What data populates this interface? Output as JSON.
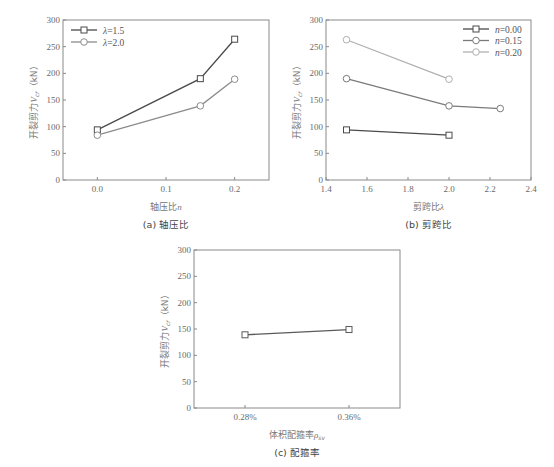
{
  "chart_data": [
    {
      "id": "a",
      "type": "line",
      "caption": "(a) 轴压比",
      "xlabel": "轴压比n",
      "ylabel": "开裂剪力V_cr（kN）",
      "xlim": [
        -0.05,
        0.25
      ],
      "ylim": [
        0,
        300
      ],
      "xticks": [
        0.0,
        0.1,
        0.2
      ],
      "xtick_labels": [
        "0.0",
        "0.1",
        "0.2"
      ],
      "yticks": [
        0,
        50,
        100,
        150,
        200,
        250,
        300
      ],
      "legend_position": "upper left",
      "grid": false,
      "series": [
        {
          "name": "λ=1.5",
          "marker": "square",
          "color": "#4a4a4a",
          "x": [
            0.0,
            0.15,
            0.2
          ],
          "values": [
            94,
            190,
            264
          ]
        },
        {
          "name": "λ=2.0",
          "marker": "circle",
          "color": "#8c8c8c",
          "x": [
            0.0,
            0.15,
            0.2
          ],
          "values": [
            84,
            139,
            189
          ]
        }
      ]
    },
    {
      "id": "b",
      "type": "line",
      "caption": "(b) 剪跨比",
      "xlabel": "剪跨比λ",
      "ylabel": "开裂剪力V_cr（kN）",
      "xlim": [
        1.4,
        2.4
      ],
      "ylim": [
        0,
        300
      ],
      "xticks": [
        1.4,
        1.6,
        1.8,
        2.0,
        2.2,
        2.4
      ],
      "xtick_labels": [
        "1.4",
        "1.6",
        "1.8",
        "2.0",
        "2.2",
        "2.4"
      ],
      "yticks": [
        0,
        50,
        100,
        150,
        200,
        250,
        300
      ],
      "legend_position": "upper right",
      "grid": false,
      "series": [
        {
          "name": "n=0.00",
          "marker": "square",
          "color": "#4a4a4a",
          "x": [
            1.5,
            2.0
          ],
          "values": [
            94,
            84
          ]
        },
        {
          "name": "n=0.15",
          "marker": "circle",
          "color": "#7a7a7a",
          "x": [
            1.5,
            2.0,
            2.25
          ],
          "values": [
            190,
            139,
            134
          ]
        },
        {
          "name": "n=0.20",
          "marker": "circle",
          "color": "#b0b0b0",
          "x": [
            1.5,
            2.0
          ],
          "values": [
            263,
            189
          ]
        }
      ]
    },
    {
      "id": "c",
      "type": "line",
      "caption": "(c) 配箍率",
      "xlabel": "体积配箍率ρ_sv",
      "ylabel": "开裂剪力V_cr（kN）",
      "categories": [
        "0.28%",
        "0.36%"
      ],
      "ylim": [
        0,
        300
      ],
      "yticks": [
        0,
        50,
        100,
        150,
        200,
        250,
        300
      ],
      "grid": false,
      "series": [
        {
          "name": "",
          "marker": "square",
          "color": "#5a5a5a",
          "values": [
            139,
            149
          ]
        }
      ]
    }
  ],
  "layout": {
    "a": {
      "left": 63,
      "top": 20,
      "right": 269,
      "bottom": 180
    },
    "b": {
      "left": 326,
      "top": 20,
      "right": 531,
      "bottom": 180
    },
    "c": {
      "left": 194,
      "top": 250,
      "right": 400,
      "bottom": 408,
      "cat_x": [
        245,
        349
      ]
    }
  }
}
